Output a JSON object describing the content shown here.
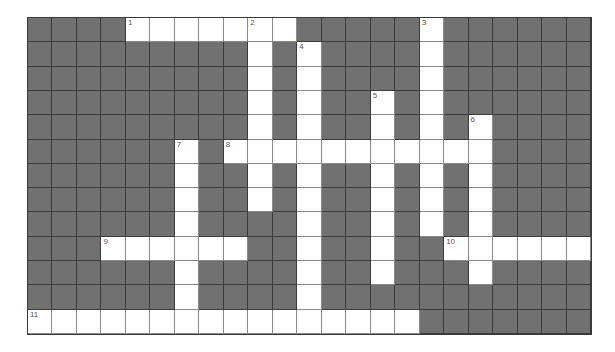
{
  "puzzle": {
    "rows": 13,
    "cols": 23,
    "colors": {
      "block": "#717171",
      "open": "#ffffff",
      "grid_line": "#3a3a3a"
    },
    "open_cells": {
      "0": [
        4,
        5,
        6,
        7,
        8,
        9,
        10,
        16
      ],
      "1": [
        9,
        11,
        16
      ],
      "2": [
        9,
        11,
        16
      ],
      "3": [
        9,
        11,
        14,
        16
      ],
      "4": [
        9,
        11,
        14,
        16,
        18
      ],
      "5": [
        6,
        8,
        9,
        10,
        11,
        12,
        13,
        14,
        15,
        16,
        17,
        18
      ],
      "6": [
        6,
        9,
        11,
        14,
        16,
        18
      ],
      "7": [
        6,
        9,
        11,
        14,
        16,
        18
      ],
      "8": [
        6,
        11,
        14,
        16,
        18
      ],
      "9": [
        3,
        4,
        5,
        6,
        7,
        8,
        11,
        14,
        17,
        18,
        19,
        20,
        21,
        22
      ],
      "10": [
        6,
        11,
        14,
        18
      ],
      "11": [
        6,
        11
      ],
      "12": [
        0,
        1,
        2,
        3,
        4,
        5,
        6,
        7,
        8,
        9,
        10,
        11,
        12,
        13,
        14,
        15
      ]
    },
    "clue_numbers": [
      {
        "n": "1",
        "row": 0,
        "col": 4
      },
      {
        "n": "2",
        "row": 0,
        "col": 9
      },
      {
        "n": "3",
        "row": 0,
        "col": 16
      },
      {
        "n": "4",
        "row": 1,
        "col": 11
      },
      {
        "n": "5",
        "row": 3,
        "col": 14
      },
      {
        "n": "6",
        "row": 4,
        "col": 18
      },
      {
        "n": "7",
        "row": 5,
        "col": 6
      },
      {
        "n": "8",
        "row": 5,
        "col": 8
      },
      {
        "n": "9",
        "row": 9,
        "col": 3
      },
      {
        "n": "10",
        "row": 9,
        "col": 17
      },
      {
        "n": "11",
        "row": 12,
        "col": 0
      }
    ]
  }
}
